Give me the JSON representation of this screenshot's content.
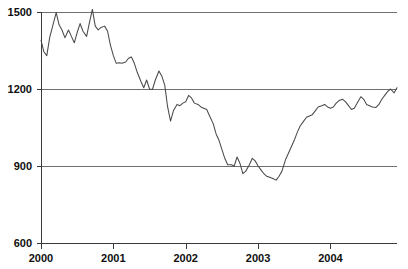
{
  "chart_data": {
    "type": "line",
    "title": "",
    "subtitle": "",
    "xlabel": "",
    "ylabel": "",
    "xlim": [
      2000.0,
      2004.92
    ],
    "ylim": [
      600,
      1500
    ],
    "y_ticks": [
      600,
      900,
      1200,
      1500
    ],
    "y_tick_labels": [
      "600",
      "900",
      "1200",
      "1500"
    ],
    "x_ticks": [
      2000,
      2001,
      2002,
      2003,
      2004
    ],
    "x_tick_labels": [
      "2000",
      "2001",
      "2002",
      "2003",
      "2004"
    ],
    "gridlines": {
      "horizontal": [
        900,
        1200,
        1500
      ],
      "vertical": []
    },
    "legend": {
      "visible": false,
      "position": "none",
      "entries": []
    },
    "series": [
      {
        "name": "index",
        "color": "#4a4a4a",
        "x": [
          2000.0,
          2000.04,
          2000.08,
          2000.12,
          2000.17,
          2000.21,
          2000.25,
          2000.29,
          2000.33,
          2000.38,
          2000.42,
          2000.46,
          2000.5,
          2000.54,
          2000.58,
          2000.63,
          2000.67,
          2000.71,
          2000.75,
          2000.79,
          2000.83,
          2000.88,
          2000.92,
          2000.96,
          2001.0,
          2001.04,
          2001.08,
          2001.12,
          2001.17,
          2001.21,
          2001.25,
          2001.29,
          2001.33,
          2001.38,
          2001.42,
          2001.46,
          2001.5,
          2001.54,
          2001.58,
          2001.63,
          2001.67,
          2001.71,
          2001.75,
          2001.79,
          2001.83,
          2001.88,
          2001.92,
          2001.96,
          2002.0,
          2002.04,
          2002.08,
          2002.12,
          2002.17,
          2002.21,
          2002.25,
          2002.29,
          2002.33,
          2002.38,
          2002.42,
          2002.46,
          2002.5,
          2002.54,
          2002.58,
          2002.63,
          2002.67,
          2002.71,
          2002.75,
          2002.79,
          2002.83,
          2002.88,
          2002.92,
          2002.96,
          2003.0,
          2003.04,
          2003.08,
          2003.12,
          2003.17,
          2003.21,
          2003.25,
          2003.29,
          2003.33,
          2003.38,
          2003.42,
          2003.46,
          2003.5,
          2003.54,
          2003.58,
          2003.63,
          2003.67,
          2003.71,
          2003.75,
          2003.79,
          2003.83,
          2003.88,
          2003.92,
          2003.96,
          2004.0,
          2004.04,
          2004.08,
          2004.12,
          2004.17,
          2004.21,
          2004.25,
          2004.29,
          2004.33,
          2004.38,
          2004.42,
          2004.46,
          2004.5,
          2004.54,
          2004.58,
          2004.63,
          2004.67,
          2004.71,
          2004.75,
          2004.79,
          2004.83,
          2004.88,
          2004.92
        ],
        "y": [
          1390,
          1345,
          1330,
          1400,
          1455,
          1498,
          1450,
          1430,
          1400,
          1430,
          1405,
          1380,
          1420,
          1455,
          1425,
          1405,
          1460,
          1510,
          1445,
          1430,
          1440,
          1445,
          1425,
          1370,
          1330,
          1300,
          1302,
          1300,
          1305,
          1320,
          1325,
          1300,
          1265,
          1230,
          1205,
          1235,
          1200,
          1198,
          1235,
          1270,
          1250,
          1215,
          1130,
          1075,
          1115,
          1140,
          1135,
          1145,
          1150,
          1175,
          1165,
          1145,
          1140,
          1130,
          1125,
          1120,
          1095,
          1065,
          1025,
          1000,
          965,
          930,
          905,
          905,
          900,
          935,
          910,
          870,
          880,
          905,
          930,
          920,
          900,
          885,
          870,
          860,
          855,
          850,
          845,
          860,
          880,
          925,
          950,
          975,
          1000,
          1030,
          1055,
          1075,
          1090,
          1095,
          1100,
          1115,
          1130,
          1135,
          1140,
          1130,
          1125,
          1130,
          1145,
          1155,
          1160,
          1150,
          1135,
          1120,
          1125,
          1150,
          1170,
          1160,
          1140,
          1135,
          1130,
          1128,
          1140,
          1160,
          1175,
          1190,
          1200,
          1185,
          1205
        ]
      }
    ]
  },
  "axes": {
    "y_axis_name": "value-axis",
    "x_axis_name": "year-axis"
  }
}
